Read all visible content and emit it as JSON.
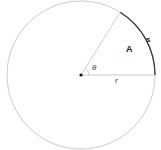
{
  "figure": {
    "labels": {
      "area": "A",
      "arc_length": "s",
      "angle": "θ",
      "radius": "r"
    },
    "icons": {
      "center_point": "center-dot-icon"
    },
    "colors": {
      "circle": "#bbbbbb",
      "radius_lines": "#cccccc",
      "arc_highlight": "#333333",
      "center_dot": "#111111",
      "text": "#222222"
    },
    "geometry": {
      "center": [
        81,
        75
      ],
      "radius": 74,
      "angle_degrees": 58
    }
  }
}
